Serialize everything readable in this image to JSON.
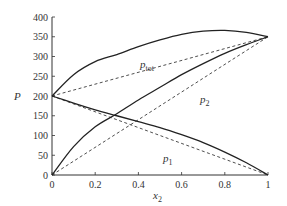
{
  "chart_data": {
    "type": "line",
    "title": "",
    "xlabel": "x2",
    "ylabel": "P",
    "xlim": [
      0,
      1
    ],
    "ylim": [
      0,
      400
    ],
    "grid": false,
    "x_ticks": [
      "0",
      "0.2",
      "0.4",
      "0.6",
      "0.8",
      "1"
    ],
    "y_ticks": [
      "0",
      "50",
      "100",
      "150",
      "200",
      "250",
      "300",
      "350",
      "400"
    ],
    "x": [
      0,
      0.1,
      0.2,
      0.3,
      0.4,
      0.5,
      0.6,
      0.7,
      0.8,
      0.9,
      1.0
    ],
    "series": [
      {
        "name": "p1",
        "style": "solid",
        "values": [
          200,
          182,
          165,
          150,
          135,
          120,
          102,
          82,
          58,
          31,
          0
        ]
      },
      {
        "name": "p2",
        "style": "solid",
        "values": [
          0,
          72,
          122,
          155,
          190,
          222,
          254,
          282,
          308,
          330,
          350
        ]
      },
      {
        "name": "ptot",
        "style": "solid",
        "values": [
          200,
          254,
          287,
          305,
          325,
          342,
          356,
          364,
          366,
          361,
          350
        ]
      },
      {
        "name": "p1 ideal (Raoult)",
        "style": "dashed",
        "values": [
          200,
          180,
          160,
          140,
          120,
          100,
          80,
          60,
          40,
          20,
          0
        ]
      },
      {
        "name": "p2 ideal (Raoult)",
        "style": "dashed",
        "values": [
          0,
          35,
          70,
          105,
          140,
          175,
          210,
          245,
          280,
          315,
          350
        ]
      },
      {
        "name": "ptot ideal",
        "style": "dashed",
        "values": [
          200,
          215,
          230,
          245,
          260,
          275,
          290,
          305,
          320,
          335,
          350
        ]
      }
    ],
    "annotations": [
      {
        "text": "p_tot",
        "x": 0.45,
        "y": 290
      },
      {
        "text": "p2",
        "x": 0.7,
        "y": 195
      },
      {
        "text": "p1",
        "x": 0.55,
        "y": 48
      }
    ]
  },
  "labels": {
    "xlabel_main": "x",
    "xlabel_sub": "2",
    "ylabel": "P",
    "ptot_main": "p",
    "ptot_sub": "tot",
    "p2_main": "p",
    "p2_sub": "2",
    "p1_main": "p",
    "p1_sub": "1"
  }
}
